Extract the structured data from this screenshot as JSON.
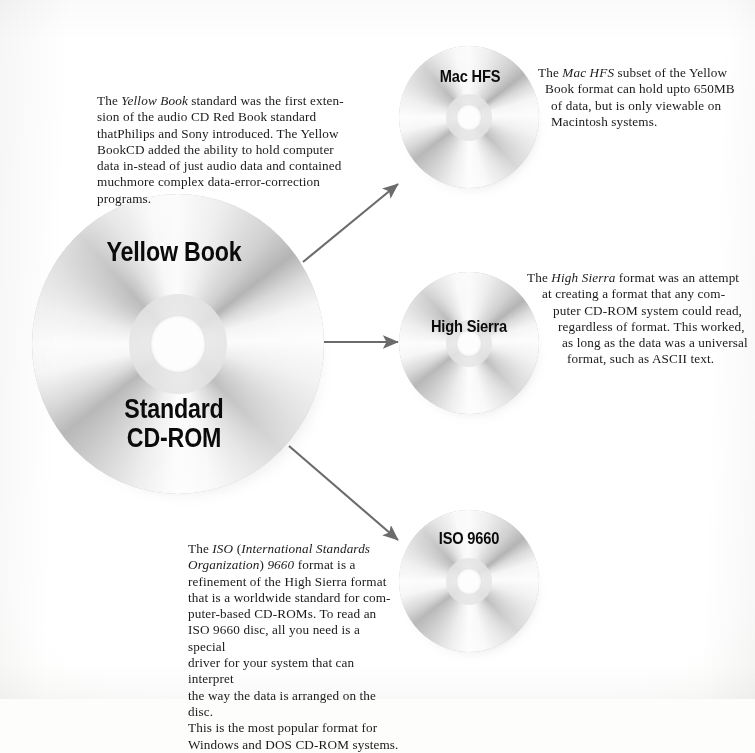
{
  "figure": {
    "type": "diagram",
    "background_color": "#fdfdfb",
    "text_color": "#1a1a1a",
    "arrow_color": "#6b6b6b"
  },
  "main_disc": {
    "label_top": "Yellow Book",
    "label_bottom": "Standard\nCD-ROM",
    "description_lines": [
      "The <i>Yellow Book</i> standard was the first exten-",
      "sion of the audio CD Red Book standard that",
      "Philips and Sony introduced. The Yellow Book",
      "CD added the ability to hold computer data in-",
      "stead of just audio data and contained much",
      "more complex data-error-correction programs."
    ]
  },
  "derived_discs": [
    {
      "id": "mac-hfs",
      "label": "Mac HFS",
      "description_lines": [
        "The <i>Mac HFS</i> subset of the Yellow",
        "Book format can hold upto 650MB",
        "of data, but is only viewable on",
        "Macintosh systems."
      ]
    },
    {
      "id": "high-sierra",
      "label": "High Sierra",
      "description_lines": [
        "The <i>High Sierra</i> format was an attempt",
        "at creating a format that any com-",
        "puter CD-ROM system could read,",
        "regardless of format. This worked,",
        "as long as the data was a universal",
        "format, such as ASCII text."
      ]
    },
    {
      "id": "iso-9660",
      "label": "ISO 9660",
      "description_lines": [
        "The <i>ISO</i> (<i>International Standards</i>",
        "<i>Organization</i>) <i>9660</i> format is a",
        "refinement of the High Sierra format",
        "that is a worldwide standard for com-",
        "puter-based CD-ROMs. To read an",
        "ISO 9660 disc, all you need is a special",
        "driver for your system that can interpret",
        "the way the data is arranged on the disc.",
        "This is the most popular format for",
        "Windows and DOS CD-ROM systems."
      ]
    }
  ],
  "arrows": [
    {
      "id": "arrow-to-mac-hfs",
      "from": [
        303,
        262
      ],
      "to": [
        400,
        185
      ],
      "direction": "up-right"
    },
    {
      "id": "arrow-to-high-sierra",
      "from": [
        310,
        342
      ],
      "to": [
        400,
        342
      ],
      "direction": "right"
    },
    {
      "id": "arrow-to-iso-9660",
      "from": [
        289,
        446
      ],
      "to": [
        400,
        542
      ],
      "direction": "down-right"
    }
  ]
}
